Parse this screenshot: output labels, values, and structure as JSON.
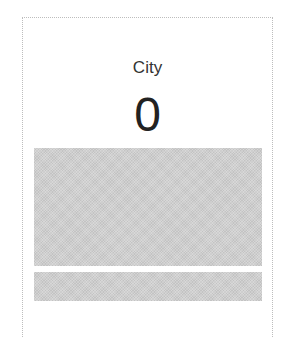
{
  "card": {
    "title": "City",
    "value": "0"
  },
  "colors": {
    "border": "#bdbdbd",
    "placeholder": "#cfcfcf",
    "text": "#333333"
  }
}
